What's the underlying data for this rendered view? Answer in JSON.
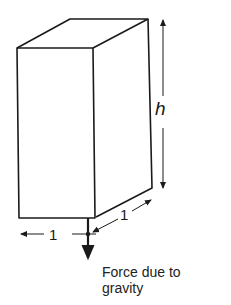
{
  "diagram": {
    "labels": {
      "height": "h",
      "width": "1",
      "depth": "1",
      "force_line1": "Force due to",
      "force_line2": "gravity"
    },
    "colors": {
      "line": "#1a1a1a",
      "background": "#ffffff"
    }
  }
}
